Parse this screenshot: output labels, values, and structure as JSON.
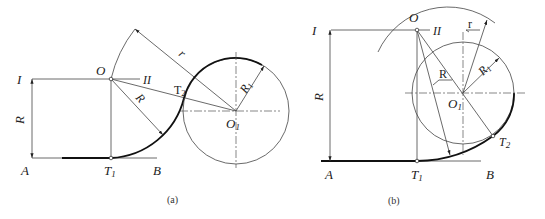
{
  "figures": [
    {
      "id": "a",
      "caption": "(a)",
      "labels": {
        "line_I": "I",
        "line_II": "II",
        "center_O": "O",
        "center_O1": "O",
        "center_O1_sub": "1",
        "tangent_T1": "T",
        "tangent_T1_sub": "1",
        "tangent_T2": "T",
        "tangent_T2_sub": "2",
        "point_A": "A",
        "point_B": "B",
        "dim_R_vertical": "R",
        "dim_R_arc": "R",
        "dim_r": "r",
        "dim_R1": "R",
        "dim_R1_sub": "1"
      }
    },
    {
      "id": "b",
      "caption": "(b)",
      "labels": {
        "line_I": "I",
        "line_II": "II",
        "center_O": "O",
        "center_O1": "O",
        "center_O1_sub": "1",
        "tangent_T1": "T",
        "tangent_T1_sub": "1",
        "tangent_T2": "T",
        "tangent_T2_sub": "2",
        "point_A": "A",
        "point_B": "B",
        "dim_R_vertical": "R",
        "dim_R_arc": "R",
        "dim_r": "r",
        "dim_R1": "R",
        "dim_R1_sub": "1"
      }
    }
  ]
}
